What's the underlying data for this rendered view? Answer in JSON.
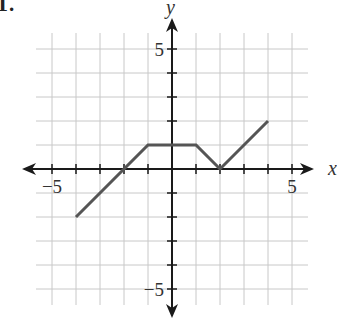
{
  "problem": {
    "number_label": "1."
  },
  "chart_data": {
    "type": "line",
    "title": "",
    "xlabel": "x",
    "ylabel": "y",
    "xlim": [
      -5.5,
      5.5
    ],
    "ylim": [
      -5.5,
      5.5
    ],
    "grid": true,
    "x_tick_labels": [
      {
        "value": -5,
        "label": "−5"
      },
      {
        "value": 5,
        "label": "5"
      }
    ],
    "y_tick_labels": [
      {
        "value": 5,
        "label": "5"
      },
      {
        "value": -5,
        "label": "−5"
      }
    ],
    "series": [
      {
        "name": "piecewise linear function",
        "color": "#555555",
        "points": [
          [
            -4,
            -2
          ],
          [
            -1,
            1
          ],
          [
            1,
            1
          ],
          [
            2,
            0
          ],
          [
            4,
            2
          ]
        ]
      }
    ]
  },
  "layout": {
    "origin_px": [
      172,
      169
    ],
    "unit_px": 24
  }
}
